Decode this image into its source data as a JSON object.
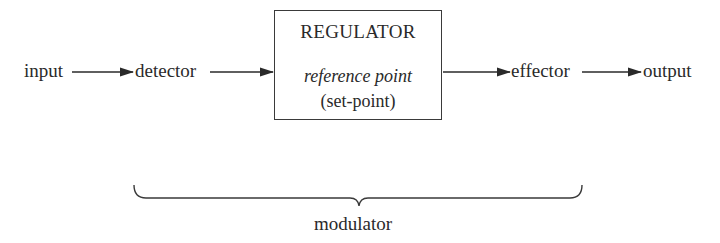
{
  "diagram": {
    "nodes": {
      "input": "input",
      "detector": "detector",
      "regulator": {
        "title": "REGULATOR",
        "subtitle": "reference point",
        "note": "(set-point)"
      },
      "effector": "effector",
      "output": "output"
    },
    "edges": [
      {
        "from": "input",
        "to": "detector"
      },
      {
        "from": "detector",
        "to": "regulator"
      },
      {
        "from": "regulator",
        "to": "effector"
      },
      {
        "from": "effector",
        "to": "output"
      }
    ],
    "brace": {
      "label": "modulator",
      "spans": [
        "detector",
        "regulator",
        "effector"
      ]
    }
  }
}
